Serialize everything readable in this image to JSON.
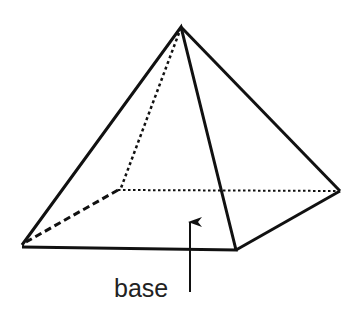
{
  "diagram": {
    "labels": [
      {
        "text": "base",
        "target": "base-face"
      }
    ],
    "colors": {
      "stroke": "#111111",
      "text": "#222222",
      "background": "#ffffff"
    },
    "vertices": {
      "apex": [
        181,
        27
      ],
      "front_left": [
        22,
        245
      ],
      "front_right": [
        236,
        250
      ],
      "back_right": [
        340,
        191
      ],
      "back_left": [
        118,
        190
      ]
    }
  }
}
